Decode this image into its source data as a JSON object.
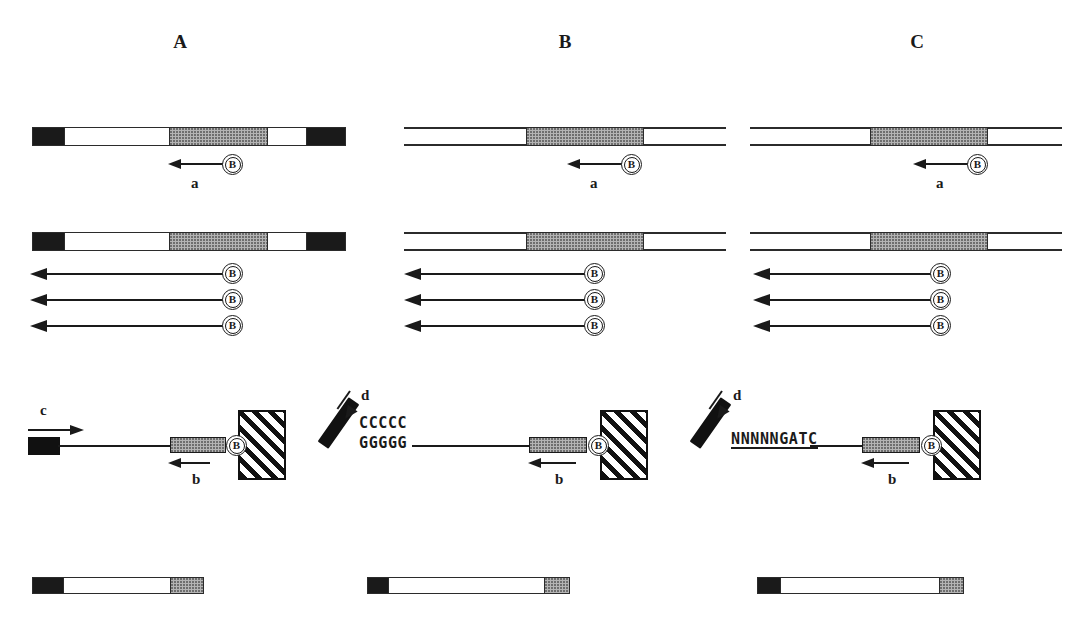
{
  "figure": {
    "background_color": "#ffffff",
    "width": 1082,
    "height": 617,
    "panel_letters": [
      "A",
      "B",
      "C"
    ],
    "colors": {
      "ink": "#1a1a1a",
      "stipple_gray": "#b4b4b4",
      "black_block": "#111111",
      "paper": "#ffffff"
    }
  },
  "panels": {
    "A": {
      "letter": "A",
      "row1": {
        "template_type": "solid-block-bar",
        "primer_label": "a",
        "biotin_label": "B"
      },
      "row2": {
        "template_type": "solid-block-bar",
        "extension_products": [
          {
            "biotin_label": "B"
          },
          {
            "biotin_label": "B"
          },
          {
            "biotin_label": "B"
          }
        ]
      },
      "row3": {
        "left_feature": "black-block-end",
        "arrow_top_label": "c",
        "arrow_bottom_label": "b",
        "biotin_label": "B",
        "support": "hatched-bead",
        "sequence_lines": []
      },
      "row4": {
        "segments": [
          "black",
          "white",
          "gray"
        ]
      }
    },
    "B": {
      "letter": "B",
      "row1": {
        "template_type": "open-duplex-rails",
        "primer_label": "a",
        "biotin_label": "B"
      },
      "row2": {
        "template_type": "open-duplex-rails",
        "extension_products": [
          {
            "biotin_label": "B"
          },
          {
            "biotin_label": "B"
          },
          {
            "biotin_label": "B"
          }
        ]
      },
      "row3": {
        "left_feature": "diagonal-oligo",
        "arrow_diagonal_label": "d",
        "arrow_bottom_label": "b",
        "biotin_label": "B",
        "support": "hatched-bead",
        "sequence_lines": [
          "CCCCC",
          "GGGGG"
        ]
      },
      "row4": {
        "segments": [
          "black",
          "white",
          "gray"
        ]
      }
    },
    "C": {
      "letter": "C",
      "row1": {
        "template_type": "open-duplex-rails",
        "primer_label": "a",
        "biotin_label": "B"
      },
      "row2": {
        "template_type": "open-duplex-rails",
        "extension_products": [
          {
            "biotin_label": "B"
          },
          {
            "biotin_label": "B"
          },
          {
            "biotin_label": "B"
          }
        ]
      },
      "row3": {
        "left_feature": "diagonal-oligo",
        "arrow_diagonal_label": "d",
        "arrow_bottom_label": "b",
        "biotin_label": "B",
        "support": "hatched-bead",
        "sequence_lines": [
          "NNNNNGATC"
        ]
      },
      "row4": {
        "segments": [
          "black",
          "white",
          "gray"
        ]
      }
    }
  }
}
